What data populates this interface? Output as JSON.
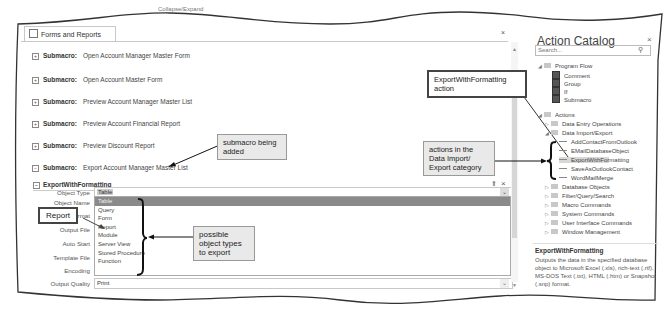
{
  "header": {
    "collapse_expand": "Collapse/Expand"
  },
  "document_tab": {
    "label": "Forms and Reports",
    "close": "×"
  },
  "submacros": [
    {
      "keyword": "Submacro:",
      "name": "Open Account Manager Master Form",
      "expanded": false
    },
    {
      "keyword": "Submacro:",
      "name": "Open Account Master Form",
      "expanded": false
    },
    {
      "keyword": "Submacro:",
      "name": "Preview Account Manager Master List",
      "expanded": false
    },
    {
      "keyword": "Submacro:",
      "name": "Preview Account Financial Report",
      "expanded": false
    },
    {
      "keyword": "Submacro:",
      "name": "Preview Discount Report",
      "expanded": false
    },
    {
      "keyword": "Submacro:",
      "name": "Export Account Manager Master List",
      "expanded": true
    }
  ],
  "action_block": {
    "name": "ExportWithFormatting",
    "fields": [
      {
        "label": "Object Type",
        "value": "Table"
      },
      {
        "label": "Object Name",
        "value": ""
      },
      {
        "label": "Output Format",
        "value": ""
      },
      {
        "label": "Output File",
        "value": ""
      },
      {
        "label": "Auto Start",
        "value": ""
      },
      {
        "label": "Template File",
        "value": ""
      },
      {
        "label": "Encoding",
        "value": ""
      },
      {
        "label": "Output Quality",
        "value": "Print"
      }
    ],
    "object_type_options": [
      "Table",
      "Query",
      "Form",
      "Report",
      "Module",
      "Server View",
      "Stored Procedure",
      "Function"
    ],
    "selected_option": "Table"
  },
  "callouts": {
    "submacro_added": "submacro being added",
    "report": "Report",
    "object_types": "possible object types to export",
    "export_action": "ExportWithFormatting action",
    "data_import_export": "actions in the Data Import/ Export category"
  },
  "action_catalog": {
    "title": "Action Catalog",
    "close": "×",
    "search_placeholder": "Search...",
    "program_flow": {
      "label": "Program Flow",
      "items": [
        "Comment",
        "Group",
        "If",
        "Submacro"
      ]
    },
    "actions": {
      "label": "Actions",
      "categories": [
        {
          "label": "Data Entry Operations",
          "expanded": false
        },
        {
          "label": "Data Import/Export",
          "expanded": true,
          "items": [
            "AddContactFromOutlook",
            "EMailDatabaseObject",
            "ExportWithFormatting",
            "SaveAsOutlookContact",
            "WordMailMerge"
          ]
        },
        {
          "label": "Database Objects",
          "expanded": false
        },
        {
          "label": "Filter/Query/Search",
          "expanded": false
        },
        {
          "label": "Macro Commands",
          "expanded": false
        },
        {
          "label": "System Commands",
          "expanded": false
        },
        {
          "label": "User Interface Commands",
          "expanded": false
        },
        {
          "label": "Window Management",
          "expanded": false
        }
      ],
      "selected_item": "ExportWithFormatting"
    },
    "description": {
      "title": "ExportWithFormatting",
      "text": "Outputs the data in the specified database object to Microsoft Excel (.xls), rich-text (.rtf), MS-DOS Text (.txt), HTML (.htm) or Snapshot (.snp) format."
    }
  },
  "colors": {
    "selected_option_bg": "#8a8a8a",
    "callout_bg": "#e9e9e9",
    "highlight_bg": "#d8d8d8"
  }
}
